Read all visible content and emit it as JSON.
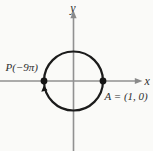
{
  "figure": {
    "labels": {
      "y_axis": "y",
      "x_axis": "x",
      "point_p": "P(−9π)",
      "point_a": "A = (1, 0)"
    },
    "points": [
      {
        "name": "P",
        "label": "P(−9π)",
        "location": "(−1, 0)"
      },
      {
        "name": "A",
        "label": "A = (1, 0)",
        "location": "(1, 0)"
      }
    ],
    "direction": "clockwise",
    "colors": {
      "background": "#fafaf8",
      "axis": "#919191",
      "curve": "#1b1b1b",
      "text": "#2f2f2f"
    }
  }
}
